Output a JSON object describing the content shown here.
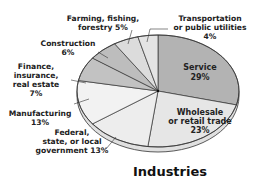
{
  "chart_data": {
    "type": "pie",
    "title": "Industries",
    "unit": "%",
    "slices": [
      {
        "name": "Service",
        "label_lines": [
          "Service",
          "29%"
        ],
        "value": 29,
        "color": "#b3b3b3",
        "label_position": "inside"
      },
      {
        "name": "Wholesale or retail trade",
        "label_lines": [
          "Wholesale",
          "or retail trade",
          "23%"
        ],
        "value": 23,
        "color": "#e6e6e6",
        "label_position": "inside"
      },
      {
        "name": "Federal, state, or local government",
        "label_lines": [
          "Federal,",
          "state, or local",
          "government 13%"
        ],
        "value": 13,
        "color": "#ededed",
        "label_position": "outside"
      },
      {
        "name": "Manufacturing",
        "label_lines": [
          "Manufacturing",
          "13%"
        ],
        "value": 13,
        "color": "#f2f2f2",
        "label_position": "outside"
      },
      {
        "name": "Finance, insurance, real estate",
        "label_lines": [
          "Finance,",
          "insurance,",
          "real estate",
          "7%"
        ],
        "value": 7,
        "color": "#c2c2c2",
        "label_position": "outside"
      },
      {
        "name": "Construction",
        "label_lines": [
          "Construction",
          "6%"
        ],
        "value": 6,
        "color": "#bdbdbd",
        "label_position": "outside"
      },
      {
        "name": "Farming, fishing, forestry",
        "label_lines": [
          "Farming, fishing,",
          "forestry 5%"
        ],
        "value": 5,
        "color": "#dcdcdc",
        "label_position": "outside"
      },
      {
        "name": "Transportation or public utilities",
        "label_lines": [
          "Transportation",
          "or public utilities",
          "4%"
        ],
        "value": 4,
        "color": "#e4e4e4",
        "label_position": "outside"
      }
    ],
    "start": "top",
    "direction": "clockwise",
    "legend": "none"
  }
}
